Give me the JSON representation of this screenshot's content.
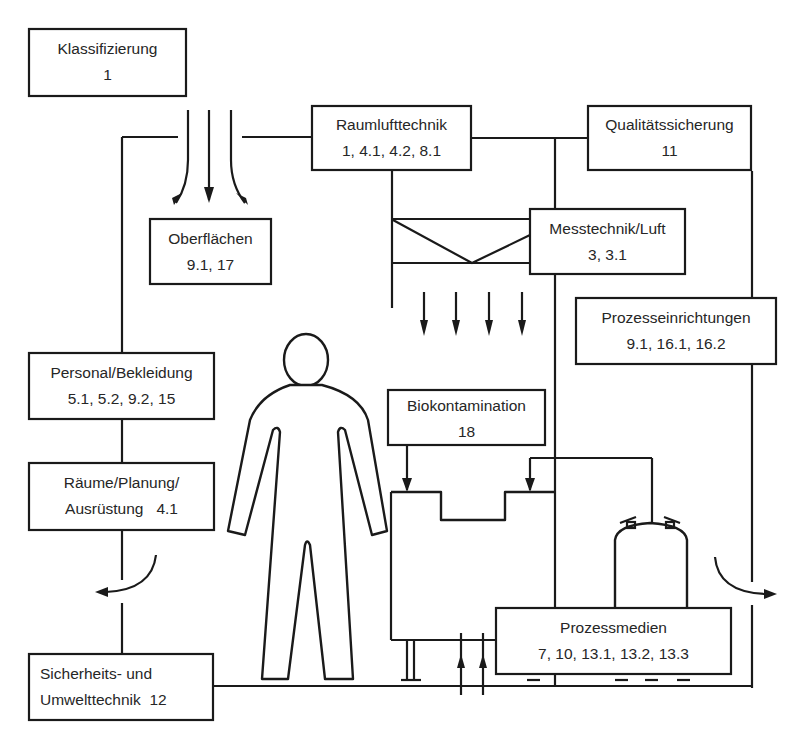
{
  "diagram": {
    "title": "",
    "colors": {
      "stroke": "#1a1a1a",
      "text": "#262626",
      "background": "#ffffff"
    },
    "boxes": {
      "klassifizierung": {
        "line1": "Klassifizierung",
        "line2": "1"
      },
      "raumlufttechnik": {
        "line1": "Raumlufttechnik",
        "line2": "1, 4.1, 4.2, 8.1"
      },
      "qualitaetssicherung": {
        "line1": "Qualitätssicherung",
        "line2": "11"
      },
      "oberflaechen": {
        "line1": "Oberflächen",
        "line2": "9.1, 17"
      },
      "messtechnik": {
        "line1": "Messtechnik/Luft",
        "line2": "3, 3.1"
      },
      "prozesseinrichtungen": {
        "line1": "Prozesseinrichtungen",
        "line2": "9.1, 16.1, 16.2"
      },
      "personal": {
        "line1": "Personal/Bekleidung",
        "line2": "5.1, 5.2, 9.2, 15"
      },
      "biokontamination": {
        "line1": "Biokontamination",
        "line2": "18"
      },
      "raeume": {
        "line1": "Räume/Planung/",
        "line2": "Ausrüstung   4.1"
      },
      "prozessmedien": {
        "line1": "Prozessmedien",
        "line2": "7, 10, 13.1, 13.2, 13.3"
      },
      "sicherheit": {
        "line1": "Sicherheits- und",
        "line2": "Umwelttechnik  12"
      }
    },
    "icons": [
      "downflow-arrows-icon",
      "filter-icon",
      "laminar-flow-arrows-icon",
      "person-coverall-icon",
      "process-machine-icon",
      "pressure-vessel-icon",
      "exhaust-arrow-icon"
    ]
  }
}
